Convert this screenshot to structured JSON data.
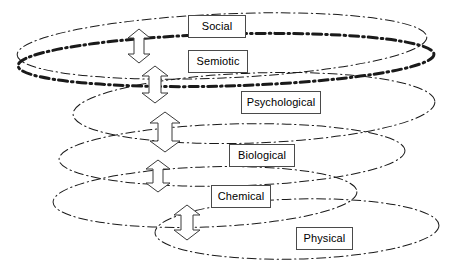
{
  "diagram": {
    "type": "layered-ellipse-hierarchy",
    "title": "",
    "background_color": "#ffffff",
    "line_color": "#1a1a1a",
    "label_border_color": "#4a4a4a",
    "label_text_color": "#000000",
    "layers": [
      {
        "id": "social",
        "label": "Social",
        "label_box": {
          "x": 188,
          "y": 15,
          "w": 58,
          "h": 23
        },
        "ellipse": {
          "cx": 222,
          "cy": 46,
          "rx": 205,
          "ry": 32,
          "rot": -2.5
        },
        "line_style": "dash-dot",
        "line_width": 1,
        "emphasis": false
      },
      {
        "id": "semiotic",
        "label": "Semiotic",
        "label_box": {
          "x": 188,
          "y": 50,
          "w": 60,
          "h": 23
        },
        "ellipse": {
          "cx": 226,
          "cy": 60,
          "rx": 208,
          "ry": 26,
          "rot": -1.6
        },
        "line_style": "dash-dot",
        "line_width": 3,
        "emphasis": true
      },
      {
        "id": "psychological",
        "label": "Psychological",
        "label_box": {
          "x": 241,
          "y": 91,
          "w": 80,
          "h": 23
        },
        "ellipse": {
          "cx": 254,
          "cy": 108,
          "rx": 181,
          "ry": 35,
          "rot": -2.0
        },
        "line_style": "dash-dot",
        "line_width": 1,
        "emphasis": false
      },
      {
        "id": "biological",
        "label": "Biological",
        "label_box": {
          "x": 229,
          "y": 144,
          "w": 66,
          "h": 23
        },
        "ellipse": {
          "cx": 232,
          "cy": 155,
          "rx": 173,
          "ry": 31,
          "rot": -1.5
        },
        "line_style": "dash-dot",
        "line_width": 1,
        "emphasis": false
      },
      {
        "id": "chemical",
        "label": "Chemical",
        "label_box": {
          "x": 211,
          "y": 185,
          "w": 60,
          "h": 23
        },
        "ellipse": {
          "cx": 205,
          "cy": 197,
          "rx": 152,
          "ry": 30,
          "rot": -2.0
        },
        "line_style": "dash-dot",
        "line_width": 1,
        "emphasis": false
      },
      {
        "id": "physical",
        "label": "Physical",
        "label_box": {
          "x": 296,
          "y": 227,
          "w": 57,
          "h": 23
        },
        "ellipse": {
          "cx": 297,
          "cy": 229,
          "rx": 142,
          "ry": 30,
          "rot": -1.5
        },
        "line_style": "dash-dot",
        "line_width": 1,
        "emphasis": false
      }
    ],
    "arrows": [
      {
        "id": "social-semiotic",
        "from": "social",
        "to": "semiotic",
        "cx": 139,
        "top": 29,
        "bottom": 63,
        "half_width": 11,
        "shaft_half_width": 5,
        "head_height": 9
      },
      {
        "id": "semiotic-psychological",
        "from": "semiotic",
        "to": "psychological",
        "cx": 155,
        "top": 66,
        "bottom": 103,
        "half_width": 13,
        "shaft_half_width": 6,
        "head_height": 10
      },
      {
        "id": "psychological-biological",
        "from": "psychological",
        "to": "biological",
        "cx": 165,
        "top": 112,
        "bottom": 152,
        "half_width": 15,
        "shaft_half_width": 7,
        "head_height": 11
      },
      {
        "id": "biological-chemical",
        "from": "biological",
        "to": "chemical",
        "cx": 158,
        "top": 160,
        "bottom": 192,
        "half_width": 12,
        "shaft_half_width": 5,
        "head_height": 9
      },
      {
        "id": "chemical-physical",
        "from": "chemical",
        "to": "physical",
        "cx": 187,
        "top": 205,
        "bottom": 240,
        "half_width": 13,
        "shaft_half_width": 6,
        "head_height": 10
      }
    ]
  }
}
